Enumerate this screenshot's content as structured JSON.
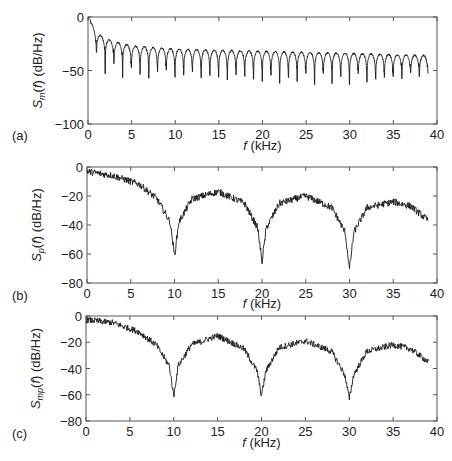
{
  "chart_data": [
    {
      "id": "a",
      "type": "line",
      "panel_label": "(a)",
      "title": "",
      "xlabel": "f (kHz)",
      "xlabel_italic": "f",
      "xlabel_rest": " (kHz)",
      "ylabel": "S_m(f) (dB/Hz)",
      "ylabel_main": "S",
      "ylabel_sub": "m",
      "ylabel_rest": "(f) (dB/Hz)",
      "xlim": [
        0,
        40
      ],
      "ylim": [
        -100,
        0
      ],
      "xticks": [
        0,
        5,
        10,
        15,
        20,
        25,
        30,
        35,
        40
      ],
      "yticks": [
        0,
        -50,
        -100
      ],
      "grid": false,
      "description": "Comb-like spectrum: peaks every ~1 kHz decaying from 0 dB to ~-35 dB, deep nulls between peaks (~-40 to -65 dB).",
      "envelope_points": [
        [
          0,
          0
        ],
        [
          1,
          -15
        ],
        [
          2,
          -20
        ],
        [
          3,
          -23
        ],
        [
          5,
          -27
        ],
        [
          10,
          -30
        ],
        [
          20,
          -32
        ],
        [
          30,
          -34
        ],
        [
          39,
          -36
        ]
      ],
      "null_depths": [
        -35,
        -60,
        -47,
        -63,
        -50,
        -58,
        -62,
        -55,
        -52,
        -60,
        -58,
        -55,
        -62,
        -58,
        -60,
        -63,
        -58,
        -60,
        -62,
        -65,
        -58,
        -68,
        -60,
        -65,
        -55,
        -68,
        -55,
        -68,
        -60,
        -68,
        -55,
        -65,
        -62,
        -60,
        -58,
        -62,
        -55,
        -58,
        -55,
        -60
      ],
      "peak_spacing_khz": 1.0,
      "x_end": 39
    },
    {
      "id": "b",
      "type": "line",
      "panel_label": "(b)",
      "title": "",
      "xlabel": "f (kHz)",
      "xlabel_italic": "f",
      "xlabel_rest": " (kHz)",
      "ylabel": "S_p(f) (dB/Hz)",
      "ylabel_main": "S",
      "ylabel_sub": "p",
      "ylabel_rest": "(f) (dB/Hz)",
      "xlim": [
        0,
        40
      ],
      "ylim": [
        -80,
        0
      ],
      "xticks": [
        0,
        5,
        10,
        15,
        20,
        25,
        30,
        35,
        40
      ],
      "yticks": [
        0,
        -20,
        -40,
        -60,
        -80
      ],
      "grid": false,
      "description": "Noisy spectrum with nulls at 10, 20, 30 kHz; lobes peak ~-17 dB (15 kHz), ~-20 dB (25 kHz), ~-24 dB (35 kHz).",
      "key_points": [
        [
          0,
          -3
        ],
        [
          3,
          -6
        ],
        [
          6,
          -12
        ],
        [
          8,
          -22
        ],
        [
          9.5,
          -38
        ],
        [
          10,
          -61
        ],
        [
          10.5,
          -38
        ],
        [
          12,
          -22
        ],
        [
          15,
          -17
        ],
        [
          18,
          -25
        ],
        [
          19.5,
          -42
        ],
        [
          20,
          -65
        ],
        [
          20.5,
          -42
        ],
        [
          22,
          -25
        ],
        [
          25,
          -20
        ],
        [
          28,
          -28
        ],
        [
          29.5,
          -45
        ],
        [
          30,
          -70
        ],
        [
          30.5,
          -45
        ],
        [
          32,
          -28
        ],
        [
          35,
          -24
        ],
        [
          37,
          -27
        ],
        [
          39,
          -37
        ]
      ],
      "noise_db": 3.0,
      "x_end": 39
    },
    {
      "id": "c",
      "type": "line",
      "panel_label": "(c)",
      "title": "",
      "xlabel": "f (kHz)",
      "xlabel_italic": "f",
      "xlabel_rest": " (kHz)",
      "ylabel": "S_mp(f) (dB/Hz)",
      "ylabel_main": "S",
      "ylabel_sub": "mp",
      "ylabel_rest": "(f) (dB/Hz)",
      "xlim": [
        0,
        40
      ],
      "ylim": [
        -80,
        0
      ],
      "xticks": [
        0,
        5,
        10,
        15,
        20,
        25,
        30,
        35,
        40
      ],
      "yticks": [
        0,
        -20,
        -40,
        -60,
        -80
      ],
      "grid": false,
      "description": "Noisy spectrum with nulls at 10, 20, 30 kHz; lobes peak ~-15 dB (15 kHz), ~-19 dB (25 kHz), ~-22 dB (35 kHz).",
      "key_points": [
        [
          0,
          -3
        ],
        [
          3,
          -5
        ],
        [
          6,
          -12
        ],
        [
          8,
          -22
        ],
        [
          9.5,
          -38
        ],
        [
          10,
          -61
        ],
        [
          10.5,
          -38
        ],
        [
          12,
          -22
        ],
        [
          15,
          -15
        ],
        [
          18,
          -25
        ],
        [
          19.5,
          -42
        ],
        [
          20,
          -61
        ],
        [
          20.5,
          -42
        ],
        [
          22,
          -24
        ],
        [
          25,
          -19
        ],
        [
          28,
          -27
        ],
        [
          29.5,
          -45
        ],
        [
          30,
          -63
        ],
        [
          30.5,
          -45
        ],
        [
          32,
          -27
        ],
        [
          35,
          -22
        ],
        [
          37,
          -25
        ],
        [
          39,
          -35
        ]
      ],
      "noise_db": 3.0,
      "x_end": 39
    }
  ],
  "layout": {
    "panels": [
      {
        "left": 88,
        "top": 17,
        "right": 437,
        "bottom": 124,
        "tag_x": 12,
        "tag_y": 140,
        "xlabel_y": 150
      },
      {
        "left": 87,
        "top": 167,
        "right": 437,
        "bottom": 283,
        "tag_x": 12,
        "tag_y": 300,
        "xlabel_y": 308
      },
      {
        "left": 86,
        "top": 316,
        "right": 437,
        "bottom": 421,
        "tag_x": 12,
        "tag_y": 438,
        "xlabel_y": 447
      }
    ]
  },
  "colors": {
    "line": "#1a1a1a",
    "axes": "#555555",
    "text": "#222222",
    "background": "#ffffff"
  }
}
